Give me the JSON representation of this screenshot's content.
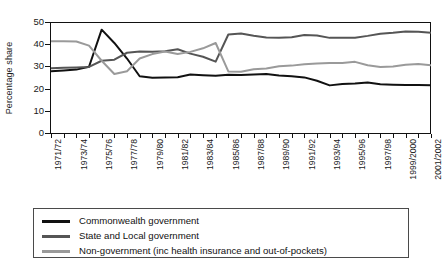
{
  "chart_data": {
    "type": "line",
    "title": "",
    "xlabel": "",
    "ylabel": "Percentage share",
    "ylim": [
      0,
      50
    ],
    "yticks": [
      0,
      10,
      20,
      30,
      40,
      50
    ],
    "grid": false,
    "legend_position": "bottom",
    "x": [
      "1971/72",
      "1972/73",
      "1973/74",
      "1974/75",
      "1975/76",
      "1976/77",
      "1977/78",
      "1978/79",
      "1979/80",
      "1980/81",
      "1981/82",
      "1982/83",
      "1983/84",
      "1984/85",
      "1985/86",
      "1986/87",
      "1987/88",
      "1988/89",
      "1989/90",
      "1990/91",
      "1991/92",
      "1992/93",
      "1993/94",
      "1994/95",
      "1995/96",
      "1996/97",
      "1997/98",
      "1998/99",
      "1999/2000",
      "2000/2001",
      "2001/2002"
    ],
    "tick_labels": [
      "1971/72",
      "1973/74",
      "1975/76",
      "1977/78",
      "1979/80",
      "1981/82",
      "1983/84",
      "1985/86",
      "1987/88",
      "1989/90",
      "1991/92",
      "1993/94",
      "1995/96",
      "1997/98",
      "1999/2000",
      "2001/2002"
    ],
    "tick_label_every": 2,
    "series": [
      {
        "name": "Commonwealth government",
        "color": "#111111",
        "values": [
          28.3,
          28.6,
          29.0,
          30.3,
          47.0,
          41.0,
          34.0,
          26.0,
          25.3,
          25.5,
          25.6,
          26.8,
          26.5,
          26.2,
          26.7,
          26.6,
          26.8,
          27.0,
          26.4,
          26.0,
          25.5,
          24.0,
          21.9,
          22.5,
          22.7,
          23.2,
          22.4,
          22.2,
          22.1,
          22.1,
          22.0
        ]
      },
      {
        "name": "State and Local government",
        "color": "#555555",
        "values": [
          29.6,
          29.8,
          30.0,
          30.2,
          33.0,
          33.5,
          36.6,
          37.2,
          37.0,
          37.3,
          38.2,
          36.2,
          34.8,
          32.6,
          44.8,
          45.3,
          44.3,
          43.5,
          43.3,
          43.6,
          44.6,
          44.4,
          43.3,
          43.4,
          43.4,
          44.2,
          45.2,
          45.6,
          46.2,
          46.1,
          45.6
        ]
      },
      {
        "name": "Non-government (inc health insurance and out-of-pockets)",
        "color": "#9a9a9a",
        "values": [
          41.8,
          41.8,
          41.7,
          39.8,
          33.0,
          27.0,
          28.3,
          34.0,
          36.0,
          37.2,
          36.0,
          37.0,
          38.6,
          41.0,
          28.2,
          28.0,
          29.2,
          29.5,
          30.5,
          30.8,
          31.4,
          31.8,
          32.0,
          32.0,
          32.5,
          31.0,
          30.2,
          30.4,
          31.2,
          31.5,
          31.0
        ]
      }
    ]
  },
  "legend": {
    "items": [
      {
        "label": "Commonwealth government",
        "color": "#111111"
      },
      {
        "label": "State and Local government",
        "color": "#555555"
      },
      {
        "label": "Non-government (inc health insurance and out-of-pockets)",
        "color": "#9a9a9a"
      }
    ]
  }
}
